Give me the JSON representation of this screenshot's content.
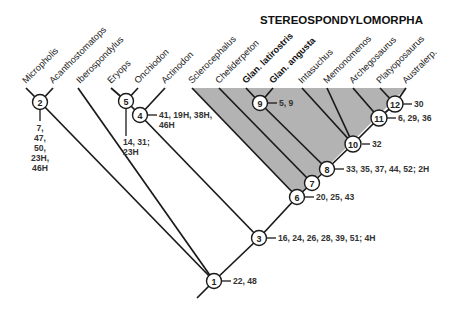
{
  "diagram": {
    "type": "cladogram",
    "clade_title": "STEREOSPONDYLOMORPHA",
    "shade_color": "#b3b3b3",
    "line_color": "#1a1a1a",
    "taxa": [
      {
        "name": "Micropholis",
        "bold": false
      },
      {
        "name": "Acanthostomatops",
        "bold": false
      },
      {
        "name": "Iberospondylus",
        "bold": false
      },
      {
        "name": "Eryops",
        "bold": false
      },
      {
        "name": "Onchiodon",
        "bold": false
      },
      {
        "name": "Actinodon",
        "bold": false
      },
      {
        "name": "Sclerocephalus",
        "bold": false
      },
      {
        "name": "Cheliderpeton",
        "bold": false
      },
      {
        "name": "Glan. latirostris",
        "bold": true
      },
      {
        "name": "Glan. angusta",
        "bold": true
      },
      {
        "name": "Intasuchus",
        "bold": false
      },
      {
        "name": "Memonomenos",
        "bold": false
      },
      {
        "name": "Archegosaurus",
        "bold": false
      },
      {
        "name": "Platyoposaurus",
        "bold": false
      },
      {
        "name": "Australerp.",
        "bold": false
      }
    ],
    "nodes": [
      {
        "id": "1",
        "characters": "22, 48"
      },
      {
        "id": "2",
        "characters": [
          "7,",
          "47,",
          "50,",
          "23H,",
          "46H"
        ]
      },
      {
        "id": "3",
        "characters": "16, 24, 26, 28, 39, 51; 4H"
      },
      {
        "id": "4",
        "characters": [
          "41, 19H, 38H,",
          "46H"
        ]
      },
      {
        "id": "5",
        "characters": [
          "14, 31;",
          "23H"
        ]
      },
      {
        "id": "6",
        "characters": "20, 25, 43"
      },
      {
        "id": "7",
        "characters": ""
      },
      {
        "id": "8",
        "characters": "33, 35, 37, 44, 52; 2H"
      },
      {
        "id": "9",
        "characters": "5, 9"
      },
      {
        "id": "10",
        "characters": "32"
      },
      {
        "id": "11",
        "characters": "6, 29, 36"
      },
      {
        "id": "12",
        "characters": "30"
      }
    ]
  }
}
